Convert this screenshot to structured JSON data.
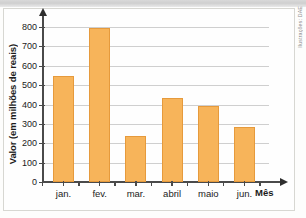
{
  "credit": "Ilustrações: DAE",
  "chart_data": {
    "type": "bar",
    "title": "",
    "xlabel": "Mês",
    "ylabel": "Valor (em milhões de reais)",
    "categories": [
      "jan.",
      "fev.",
      "mar.",
      "abril",
      "maio",
      "jun."
    ],
    "values": [
      545,
      795,
      235,
      435,
      390,
      285
    ],
    "ylim": [
      0,
      800
    ],
    "ytick_labels": [
      "0",
      "100",
      "200",
      "300",
      "400",
      "500",
      "600",
      "700",
      "800"
    ],
    "ytick_values": [
      0,
      100,
      200,
      300,
      400,
      500,
      600,
      700,
      800
    ],
    "grid": true,
    "legend": "none",
    "bar_color": "#f7b45a",
    "bar_border_color": "#e69a3c",
    "axis_color": "#4a4a4a",
    "grid_color": "#cfcfcf"
  }
}
